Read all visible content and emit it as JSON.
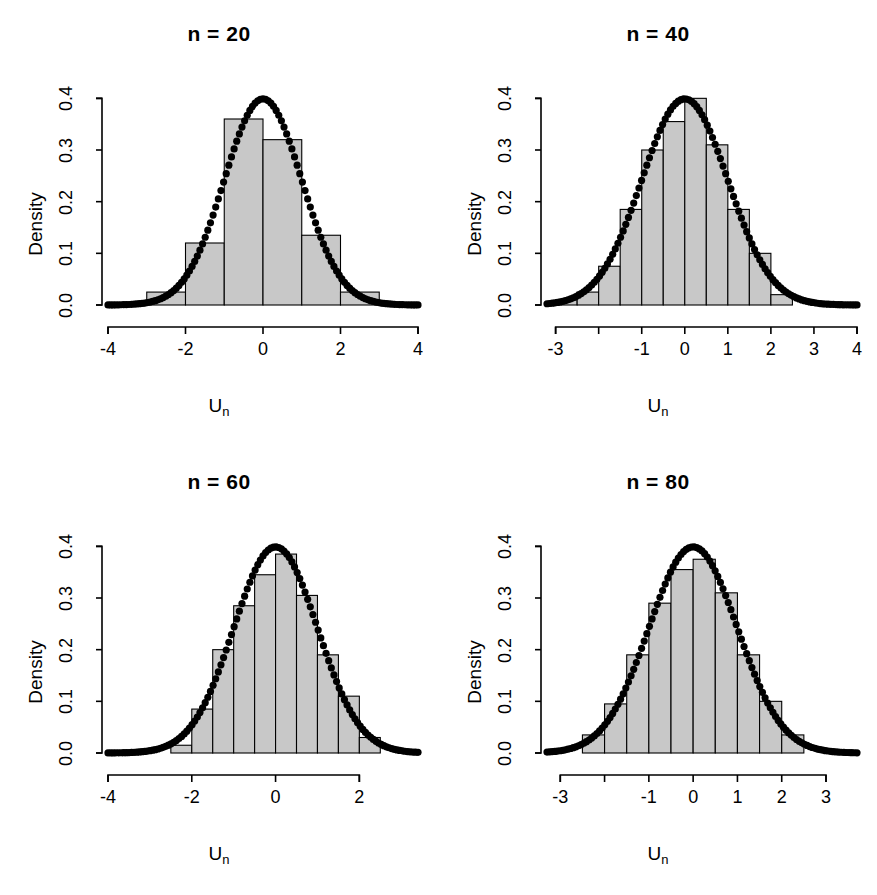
{
  "figure": {
    "layout": "2x2 grid of histogram panels",
    "background": "#ffffff",
    "bar_fill": "#c8c8c8",
    "bar_stroke": "#000000",
    "curve_color": "#000000"
  },
  "chart_data": [
    {
      "type": "bar",
      "title": "n = 20",
      "xlabel": "U",
      "xlabel_sub": "n",
      "ylabel": "Density",
      "ylim": [
        0.0,
        0.42
      ],
      "yticks": [
        0.0,
        0.1,
        0.2,
        0.3,
        0.4
      ],
      "ytick_labels": [
        "0.0",
        "0.1",
        "0.2",
        "0.3",
        "0.4"
      ],
      "xlim": [
        -4.0,
        4.0
      ],
      "xticks": [
        -4,
        -2,
        0,
        2,
        4
      ],
      "xtick_labels": [
        "-4",
        "-2",
        "0",
        "2",
        "4"
      ],
      "grid": false,
      "legend": "none",
      "bin_edges": [
        -3.0,
        -2.0,
        -1.0,
        0.0,
        1.0,
        2.0,
        3.0
      ],
      "values": [
        0.025,
        0.12,
        0.36,
        0.32,
        0.135,
        0.025
      ],
      "overlay": {
        "name": "standard normal density",
        "type": "line",
        "style": "thick dotted",
        "mean": 0.0,
        "sd": 1.0,
        "peak": 0.3989
      }
    },
    {
      "type": "bar",
      "title": "n = 40",
      "xlabel": "U",
      "xlabel_sub": "n",
      "ylabel": "Density",
      "ylim": [
        0.0,
        0.42
      ],
      "yticks": [
        0.0,
        0.1,
        0.2,
        0.3,
        0.4
      ],
      "ytick_labels": [
        "0.0",
        "0.1",
        "0.2",
        "0.3",
        "0.4"
      ],
      "xlim": [
        -3.2,
        4.0
      ],
      "xticks": [
        -3,
        -2,
        -1,
        0,
        1,
        2,
        3,
        4
      ],
      "xtick_labels": [
        "-3",
        "",
        "-1",
        "0",
        "1",
        "2",
        "3",
        "4"
      ],
      "grid": false,
      "legend": "none",
      "bin_edges": [
        -3.0,
        -2.5,
        -2.0,
        -1.5,
        -1.0,
        -0.5,
        0.0,
        0.5,
        1.0,
        1.5,
        2.0,
        2.5
      ],
      "values": [
        0.01,
        0.025,
        0.075,
        0.185,
        0.3,
        0.355,
        0.4,
        0.31,
        0.185,
        0.1,
        0.02
      ],
      "overlay": {
        "name": "standard normal density",
        "type": "line",
        "style": "thick dotted",
        "mean": 0.0,
        "sd": 1.0,
        "peak": 0.3989
      }
    },
    {
      "type": "bar",
      "title": "n = 60",
      "xlabel": "U",
      "xlabel_sub": "n",
      "ylabel": "Density",
      "ylim": [
        0.0,
        0.42
      ],
      "yticks": [
        0.0,
        0.1,
        0.2,
        0.3,
        0.4
      ],
      "ytick_labels": [
        "0.0",
        "0.1",
        "0.2",
        "0.3",
        "0.4"
      ],
      "xlim": [
        -4.0,
        3.4
      ],
      "xticks": [
        -4,
        -2,
        0,
        2
      ],
      "xtick_labels": [
        "-4",
        "-2",
        "0",
        "2"
      ],
      "grid": false,
      "legend": "none",
      "bin_edges": [
        -2.5,
        -2.0,
        -1.5,
        -1.0,
        -0.5,
        0.0,
        0.5,
        1.0,
        1.5,
        2.0,
        2.5
      ],
      "values": [
        0.015,
        0.085,
        0.2,
        0.285,
        0.345,
        0.385,
        0.305,
        0.19,
        0.11,
        0.03
      ],
      "overlay": {
        "name": "standard normal density",
        "type": "line",
        "style": "thick dotted",
        "mean": 0.0,
        "sd": 1.0,
        "peak": 0.3989
      }
    },
    {
      "type": "bar",
      "title": "n = 80",
      "xlabel": "U",
      "xlabel_sub": "n",
      "ylabel": "Density",
      "ylim": [
        0.0,
        0.42
      ],
      "yticks": [
        0.0,
        0.1,
        0.2,
        0.3,
        0.4
      ],
      "ytick_labels": [
        "0.0",
        "0.1",
        "0.2",
        "0.3",
        "0.4"
      ],
      "xlim": [
        -3.3,
        3.7
      ],
      "xticks": [
        -3,
        -2,
        -1,
        0,
        1,
        2,
        3
      ],
      "xtick_labels": [
        "-3",
        "",
        "-1",
        "0",
        "1",
        "2",
        "3"
      ],
      "grid": false,
      "legend": "none",
      "bin_edges": [
        -2.5,
        -2.0,
        -1.5,
        -1.0,
        -0.5,
        0.0,
        0.5,
        1.0,
        1.5,
        2.0,
        2.5
      ],
      "values": [
        0.035,
        0.095,
        0.19,
        0.29,
        0.355,
        0.375,
        0.31,
        0.19,
        0.1,
        0.035
      ],
      "overlay": {
        "name": "standard normal density",
        "type": "line",
        "style": "thick dotted",
        "mean": 0.0,
        "sd": 1.0,
        "peak": 0.3989
      }
    }
  ]
}
